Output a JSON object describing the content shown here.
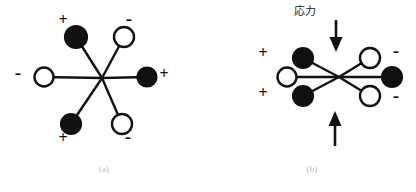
{
  "figure": {
    "panels": [
      {
        "id": "a",
        "caption": "(a)",
        "description": "unstressed six-arm dipole star",
        "center": {
          "x": 102,
          "y": 78
        },
        "arms": [
          {
            "name": "top-left",
            "fill": "black",
            "sign": "+",
            "cx": 76,
            "cy": 37,
            "sign_x": 63,
            "sign_y": 14
          },
          {
            "name": "top-right",
            "fill": "white",
            "sign": "-",
            "cx": 124,
            "cy": 37,
            "sign_x": 129,
            "sign_y": 12
          },
          {
            "name": "left",
            "fill": "white",
            "sign": "-",
            "cx": 44,
            "cy": 77,
            "sign_x": 18,
            "sign_y": 66
          },
          {
            "name": "right",
            "fill": "black",
            "sign": "+",
            "cx": 147,
            "cy": 77,
            "sign_x": 163,
            "sign_y": 69
          },
          {
            "name": "bottom-left",
            "fill": "black",
            "sign": "+",
            "cx": 71,
            "cy": 124,
            "sign_x": 63,
            "sign_y": 132
          },
          {
            "name": "bottom-right",
            "fill": "white",
            "sign": "-",
            "cx": 122,
            "cy": 124,
            "sign_x": 128,
            "sign_y": 131
          }
        ]
      },
      {
        "id": "b",
        "caption": "(b)",
        "description": "compressed six-arm dipole star under applied stress",
        "stress_label": "応力",
        "stress_label_pos": {
          "x": 88,
          "y": 6
        },
        "center": {
          "x": 131,
          "y": 76
        },
        "arrows": [
          {
            "name": "stress-arrow-top",
            "direction": "down",
            "x": 128,
            "y1": 20,
            "y2": 51
          },
          {
            "name": "stress-arrow-bottom",
            "direction": "up",
            "x": 127,
            "y1": 146,
            "y2": 112
          }
        ],
        "arms": [
          {
            "name": "top-left",
            "fill": "black",
            "sign": "+",
            "cx": 95,
            "cy": 58,
            "sign_x": 55,
            "sign_y": 48
          },
          {
            "name": "top-right",
            "fill": "white",
            "sign": "-",
            "cx": 162,
            "cy": 58,
            "sign_x": 187,
            "sign_y": 44
          },
          {
            "name": "left",
            "fill": "white",
            "sign": "",
            "cx": 79,
            "cy": 77,
            "sign_x": 0,
            "sign_y": 0
          },
          {
            "name": "right",
            "fill": "black",
            "sign": "",
            "cx": 184,
            "cy": 77,
            "sign_x": 0,
            "sign_y": 0
          },
          {
            "name": "bottom-left",
            "fill": "black",
            "sign": "+",
            "cx": 95,
            "cy": 96,
            "sign_x": 55,
            "sign_y": 88
          },
          {
            "name": "bottom-right",
            "fill": "white",
            "sign": "-",
            "cx": 162,
            "cy": 96,
            "sign_x": 187,
            "sign_y": 89
          }
        ]
      }
    ],
    "style": {
      "line_color": "#111111",
      "fill_black": "#111111",
      "fill_white": "#ffffff",
      "background": "#ffffff",
      "caption_color": "#b9b9b9"
    }
  }
}
